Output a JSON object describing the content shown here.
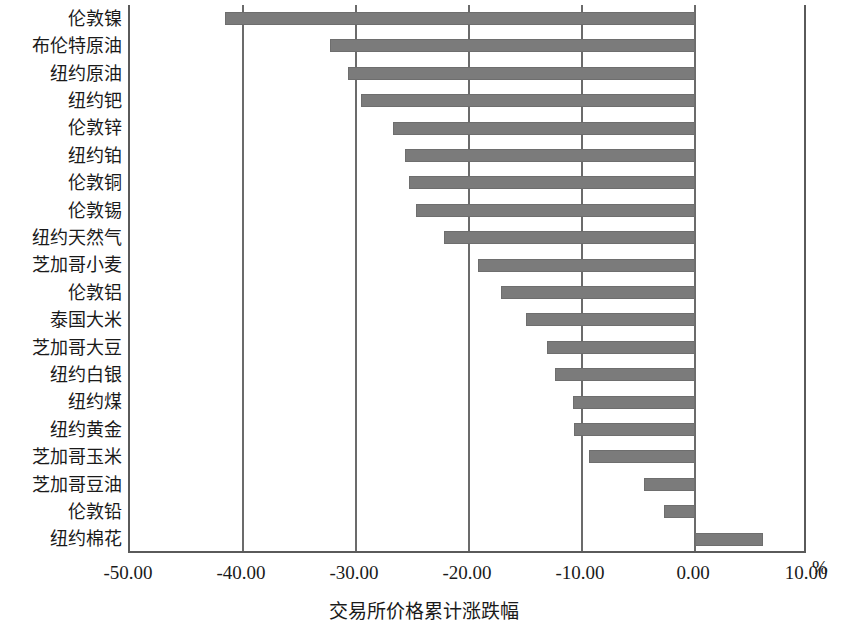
{
  "chart_data": {
    "type": "bar",
    "orientation": "horizontal",
    "title": "",
    "xlabel": "交易所价格累计涨跌幅",
    "ylabel": "",
    "unit_label": "%",
    "xlim": [
      -50.0,
      10.0
    ],
    "xticks": [
      "-50.00",
      "-40.00",
      "-30.00",
      "-20.00",
      "-10.00",
      "0.00",
      "10.00"
    ],
    "xtick_values": [
      -50,
      -40,
      -30,
      -20,
      -10,
      0,
      10
    ],
    "grid": true,
    "grid_axis": "x",
    "legend": "none",
    "bar_color": "#7b7b7b",
    "axis_color": "#5a5a5a",
    "categories": [
      "伦敦镍",
      "布伦特原油",
      "纽约原油",
      "纽约钯",
      "伦敦锌",
      "纽约铂",
      "伦敦铜",
      "伦敦锡",
      "纽约天然气",
      "芝加哥小麦",
      "伦敦铝",
      "泰国大米",
      "芝加哥大豆",
      "纽约白银",
      "纽约煤",
      "纽约黄金",
      "芝加哥玉米",
      "芝加哥豆油",
      "伦敦铅",
      "纽约棉花"
    ],
    "values": [
      -41.6,
      -32.3,
      -30.7,
      -29.6,
      -26.7,
      -25.7,
      -25.3,
      -24.7,
      -22.2,
      -19.2,
      -17.2,
      -15.0,
      -13.1,
      -12.4,
      -10.8,
      -10.7,
      -9.4,
      -4.5,
      -2.7,
      6.0
    ]
  }
}
